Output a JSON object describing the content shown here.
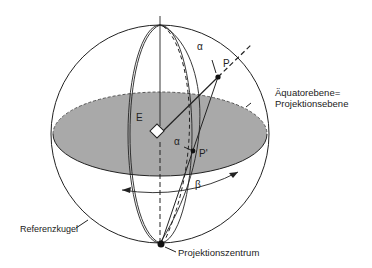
{
  "diagram": {
    "type": "stereographic-projection",
    "labels": {
      "E": "E",
      "P": "P",
      "P_prime": "P'",
      "alpha_top": "α",
      "alpha_center": "α",
      "beta": "β",
      "equator_line1": "Äquatorebene=",
      "equator_line2": "Projektionsebene",
      "reference_sphere": "Referenzkugel",
      "projection_center": "Projektionszentrum"
    },
    "colors": {
      "plane_fill": "#a9a9a9",
      "stroke": "#222222",
      "background": "#ffffff"
    }
  }
}
